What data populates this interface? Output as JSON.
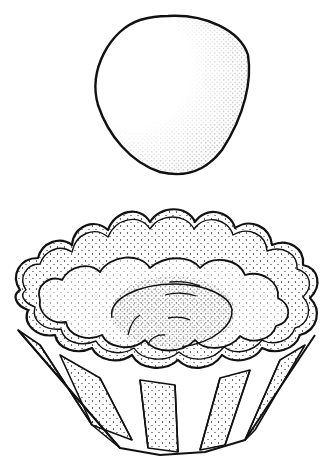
{
  "illustration": {
    "subject": "Line drawing of a ball of dough above a fluted tart tin lined with pressed dough",
    "style": "black ink outline with stipple shading",
    "colors": {
      "background": "#ffffff",
      "ink": "#111111"
    },
    "elements": [
      {
        "name": "dough-ball",
        "description": "rounded ball of dough with stippled shading on right/lower side"
      },
      {
        "name": "tart-tin",
        "description": "fluted scalloped tart mold with 12 scallops"
      },
      {
        "name": "dough-lining",
        "description": "dough pressed into tin with a swirled depression in the center"
      }
    ]
  }
}
